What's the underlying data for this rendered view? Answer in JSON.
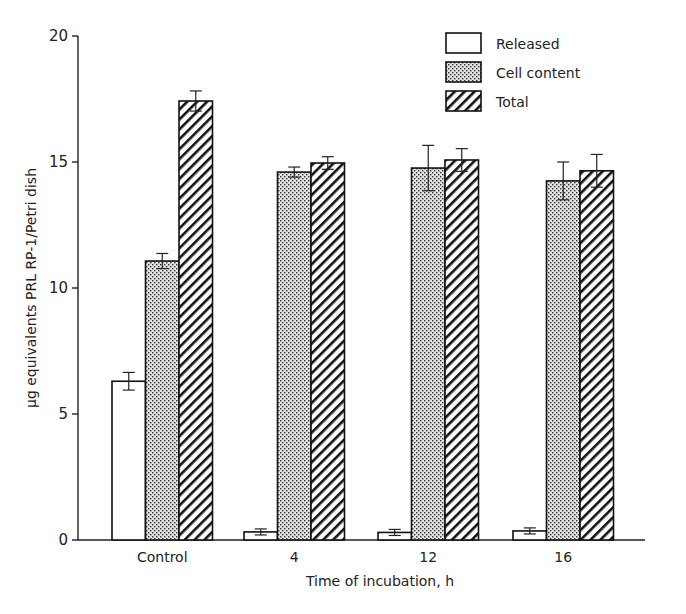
{
  "chart_data": {
    "type": "bar",
    "title": "",
    "xlabel": "Time of incubation, h",
    "ylabel": "µg equivalents PRL RP-1/Petri dish",
    "ylim": [
      0,
      20
    ],
    "yticks": [
      0,
      5,
      10,
      15,
      20
    ],
    "categories": [
      "Control",
      "4",
      "12",
      "16"
    ],
    "series": [
      {
        "name": "Released",
        "pattern": "open",
        "values": [
          6.3,
          0.32,
          0.3,
          0.36
        ],
        "errors": [
          0.35,
          0.12,
          0.12,
          0.12
        ]
      },
      {
        "name": "Cell content",
        "pattern": "stippled",
        "values": [
          11.07,
          14.6,
          14.76,
          14.25
        ],
        "errors": [
          0.3,
          0.2,
          0.9,
          0.75
        ]
      },
      {
        "name": "Total",
        "pattern": "hatched",
        "values": [
          17.42,
          14.96,
          15.08,
          14.65
        ],
        "errors": [
          0.4,
          0.25,
          0.45,
          0.65
        ]
      }
    ],
    "grid": false,
    "legend_position": "upper right"
  }
}
